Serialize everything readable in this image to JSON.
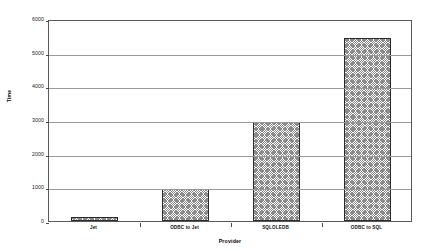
{
  "chart_data": {
    "type": "bar",
    "title": "",
    "xlabel": "Provider",
    "ylabel": "Time",
    "categories": [
      "Jet",
      "ODBC to Jet",
      "SQLOLEDB",
      "ODBC to SQL"
    ],
    "values": [
      130,
      960,
      2930,
      5450
    ],
    "ylim": [
      0,
      6000
    ],
    "yticks": [
      0,
      1000,
      2000,
      3000,
      4000,
      5000,
      6000
    ],
    "ytick_labels": [
      "0",
      "1000",
      "2000",
      "3000",
      "4000",
      "5000",
      "6000"
    ],
    "grid": true,
    "legend": false,
    "series": [
      {
        "name": "Time",
        "values": [
          130,
          960,
          2930,
          5450
        ]
      }
    ],
    "colors": {
      "bar_fill": "#8a8a8a",
      "bar_border": "#2b2b2b",
      "gridline": "#9a9a9a",
      "frame": "#5a5a5a",
      "background": "#ffffff",
      "text": "#111111"
    }
  }
}
